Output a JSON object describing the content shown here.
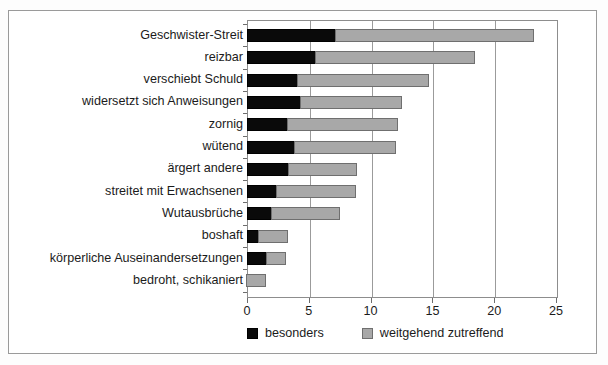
{
  "chart_data": {
    "type": "bar",
    "orientation": "horizontal",
    "stacked": true,
    "title": "",
    "xlabel": "",
    "ylabel": "",
    "xlim": [
      0,
      25
    ],
    "xticks": [
      0,
      5,
      10,
      15,
      20,
      25
    ],
    "xtick_labels": [
      "0",
      "5",
      "10",
      "15",
      "20",
      "25"
    ],
    "grid": true,
    "grid_axis": "x",
    "legend_position": "bottom",
    "categories": [
      "Geschwister-Streit",
      "reizbar",
      "verschiebt Schuld",
      "widersetzt sich Anweisungen",
      "zornig",
      "wütend",
      "ärgert andere",
      "streitet mit Erwachsenen",
      "Wutausbrüche",
      "boshaft",
      "körperliche Auseinandersetzungen",
      "bedroht, schikaniert"
    ],
    "series": [
      {
        "name": "besonders",
        "color": "#0a0a0a",
        "values": [
          7.2,
          5.6,
          4.1,
          4.4,
          3.3,
          3.9,
          3.4,
          2.4,
          2.0,
          1.0,
          1.6,
          0.0
        ]
      },
      {
        "name": "weitgehend zutreffend",
        "color": "#a8a8a8",
        "values": [
          16.1,
          12.9,
          10.7,
          8.2,
          9.0,
          8.2,
          5.6,
          6.5,
          5.6,
          2.4,
          1.6,
          1.6
        ]
      }
    ],
    "totals": [
      23.3,
      18.5,
      14.8,
      12.6,
      12.3,
      12.1,
      9.0,
      8.9,
      7.6,
      3.4,
      3.2,
      1.6
    ]
  },
  "legend": {
    "items": [
      {
        "label": "besonders",
        "swatch": "dark"
      },
      {
        "label": "weitgehend zutreffend",
        "swatch": "light"
      }
    ]
  }
}
